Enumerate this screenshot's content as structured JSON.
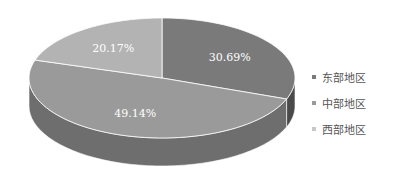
{
  "chart_data": {
    "type": "pie",
    "style": "3d",
    "title": "",
    "categories": [
      "东部地区",
      "中部地区",
      "西部地区"
    ],
    "values": [
      30.69,
      49.14,
      20.17
    ],
    "labels": [
      "30.69%",
      "49.14%",
      "20.17%"
    ],
    "colors": {
      "top": [
        "#7a7a7a",
        "#9a9a9a",
        "#b3b3b3"
      ],
      "side": [
        "#4a4a4a",
        "#6e6e6e",
        "#8a8a8a"
      ],
      "legend": [
        "#7a7a7a",
        "#9a9a9a",
        "#c8c8c8"
      ]
    },
    "legend_position": "right",
    "start_angle_deg": 0,
    "direction": "clockwise"
  },
  "legend": {
    "items": [
      {
        "label": "东部地区"
      },
      {
        "label": "中部地区"
      },
      {
        "label": "西部地区"
      }
    ]
  }
}
